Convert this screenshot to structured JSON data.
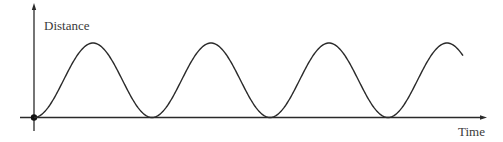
{
  "diagram": {
    "y_axis_label": "Distance",
    "x_axis_label": "Time",
    "colors": {
      "axis": "#2a2a2a",
      "curve": "#2a2a2a",
      "text": "#3a3a3a",
      "background": "#ffffff"
    }
  },
  "chart_data": {
    "type": "line",
    "title": "",
    "xlabel": "Time",
    "ylabel": "Distance",
    "grid": false,
    "legend": null,
    "series": [
      {
        "name": "Distance vs Time",
        "shape": "1 - cos wave",
        "period_units": 1,
        "cycles_shown": 3.75,
        "x": [
          0,
          0.5,
          1,
          1.5,
          2,
          2.5,
          3,
          3.5,
          3.64
        ],
        "values": [
          0,
          1,
          0,
          1,
          0,
          1,
          0,
          1,
          0.83
        ]
      }
    ]
  }
}
